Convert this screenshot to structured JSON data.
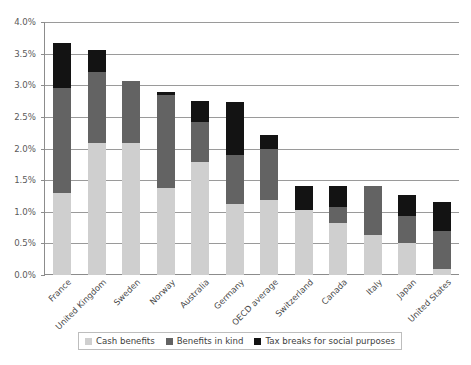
{
  "chart_data": {
    "type": "bar",
    "stacked": true,
    "title": "",
    "xlabel": "",
    "ylabel": "",
    "ylim": [
      0,
      4.0
    ],
    "ytick_labels": [
      "0.0%",
      "0.5%",
      "1.0%",
      "1.5%",
      "2.0%",
      "2.5%",
      "3.0%",
      "3.5%",
      "4.0%"
    ],
    "ytick_values": [
      0.0,
      0.5,
      1.0,
      1.5,
      2.0,
      2.5,
      3.0,
      3.5,
      4.0
    ],
    "grid": true,
    "legend_position": "bottom",
    "categories": [
      "France",
      "United Kingdom",
      "Sweden",
      "Norway",
      "Australia",
      "Germany",
      "OECD average",
      "Switzerland",
      "Canada",
      "Italy",
      "Japan",
      "United States"
    ],
    "series": [
      {
        "name": "Cash benefits",
        "color": "#cfcfcf",
        "values": [
          1.3,
          2.09,
          2.09,
          1.37,
          1.78,
          1.13,
          1.19,
          1.03,
          0.82,
          0.64,
          0.5,
          0.09
        ]
      },
      {
        "name": "Benefits in kind",
        "color": "#636363",
        "values": [
          1.66,
          1.12,
          0.97,
          1.47,
          0.64,
          0.77,
          0.81,
          0.0,
          0.26,
          0.76,
          0.44,
          0.61
        ]
      },
      {
        "name": "Tax breaks for social purposes",
        "color": "#131313",
        "values": [
          0.71,
          0.34,
          0.0,
          0.06,
          0.33,
          0.84,
          0.21,
          0.38,
          0.32,
          0.0,
          0.33,
          0.46
        ]
      }
    ],
    "totals": [
      3.67,
      3.55,
      3.06,
      2.9,
      2.75,
      2.74,
      2.21,
      1.41,
      1.4,
      1.4,
      1.27,
      1.16
    ]
  },
  "legend": {
    "items": [
      {
        "label": "Cash benefits",
        "swatch": "cash"
      },
      {
        "label": "Benefits in kind",
        "swatch": "kind"
      },
      {
        "label": "Tax breaks for social purposes",
        "swatch": "tax"
      }
    ]
  }
}
